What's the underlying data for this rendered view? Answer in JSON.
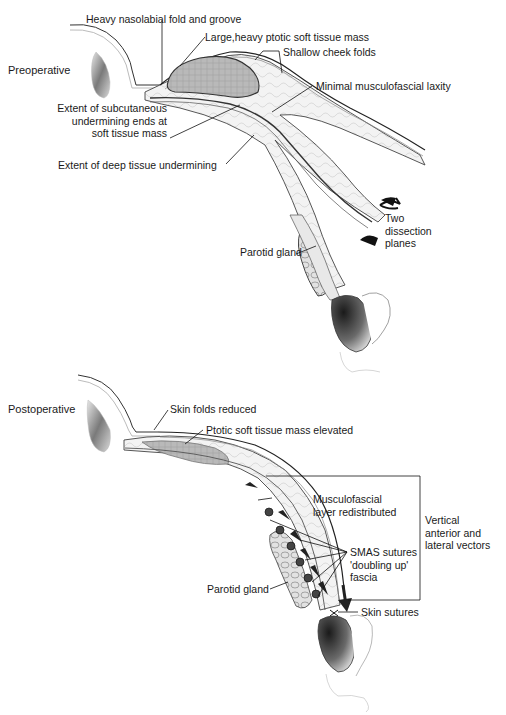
{
  "header": {
    "text": ""
  },
  "preoperative": {
    "title": "Preoperative",
    "labels": {
      "nasolabial": "Heavy nasolabial fold and groove",
      "soft_tissue_mass": "Large,heavy ptotic soft tissue mass",
      "cheek_folds": "Shallow cheek folds",
      "musculofascial": "Minimal musculofascial laxity",
      "subcutaneous_1": "Extent of subcutaneous",
      "subcutaneous_2": "undermining ends at",
      "subcutaneous_3": "soft tissue mass",
      "deep_tissue": "Extent of deep tissue undermining",
      "dissection_1": "Two",
      "dissection_2": "dissection",
      "dissection_3": "planes",
      "parotid": "Parotid gland"
    }
  },
  "postoperative": {
    "title": "Postoperative",
    "labels": {
      "skin_folds": "Skin folds reduced",
      "mass_elevated": "Ptotic soft tissue mass elevated",
      "musculofascial_1": "Musculofascial",
      "musculofascial_2": "layer redistributed",
      "vectors_1": "Vertical",
      "vectors_2": "anterior and",
      "vectors_3": "lateral vectors",
      "smas_1": "SMAS sutures",
      "smas_2": "'doubling up'",
      "smas_3": "fascia",
      "parotid": "Parotid gland",
      "skin_sutures": "Skin sutures"
    }
  }
}
